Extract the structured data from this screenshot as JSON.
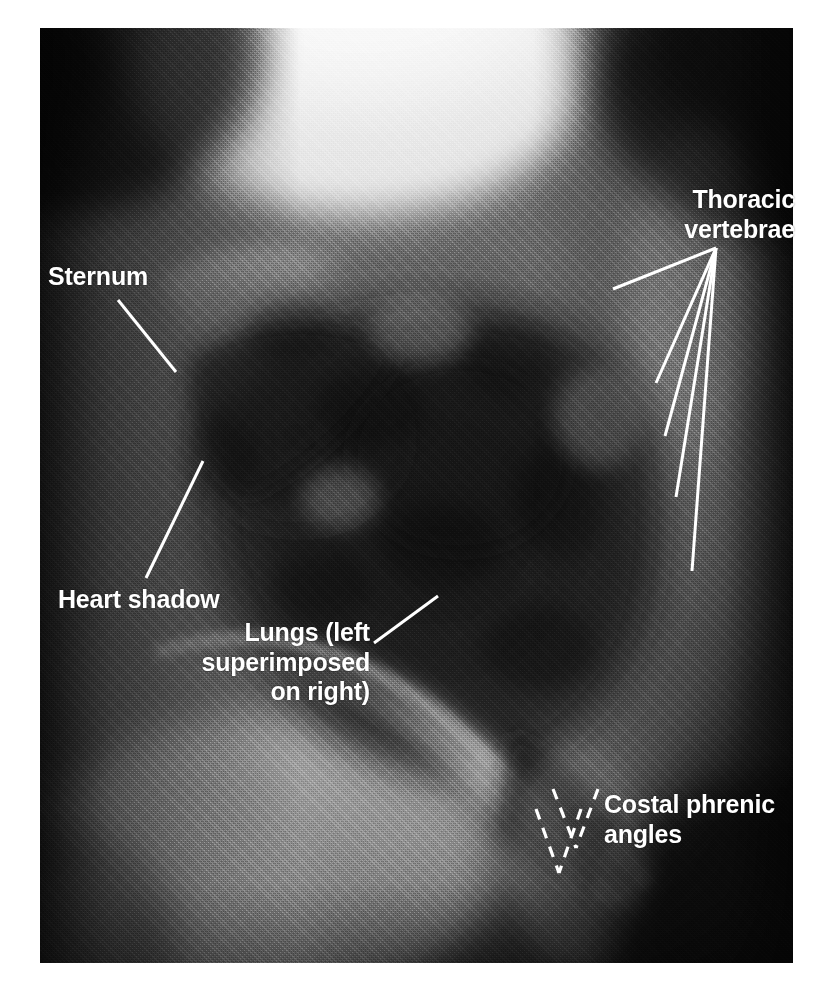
{
  "figure": {
    "kind": "annotated-lateral-chest-radiograph",
    "photo": {
      "x": 40,
      "y": 28,
      "width": 753,
      "height": 935
    },
    "page": {
      "width": 829,
      "height": 983,
      "background": "#ffffff"
    }
  },
  "colors": {
    "annotation_text": "#ffffff",
    "leader_line": "#ffffff",
    "page_background": "#ffffff",
    "film_dark": "#161616",
    "film_mid": "#6e6e6e",
    "film_bright": "#f2f2f2"
  },
  "annotations": [
    {
      "id": "sternum",
      "text": "Sternum",
      "lines": [
        "Sternum"
      ],
      "align": "left",
      "x": 48,
      "y": 262,
      "leaders": [
        {
          "x1": 118,
          "y1": 300,
          "x2": 176,
          "y2": 372
        }
      ],
      "leader_style": "solid"
    },
    {
      "id": "heart-shadow",
      "text": "Heart shadow",
      "lines": [
        "Heart shadow"
      ],
      "align": "left",
      "x": 58,
      "y": 585,
      "leaders": [
        {
          "x1": 146,
          "y1": 578,
          "x2": 203,
          "y2": 461
        }
      ],
      "leader_style": "solid"
    },
    {
      "id": "lungs",
      "text": "Lungs (left superimposed on right)",
      "lines": [
        "Lungs (left",
        "superimposed",
        "on right)"
      ],
      "align": "right",
      "x": 130,
      "y": 618,
      "width": 240,
      "leaders": [
        {
          "x1": 374,
          "y1": 643,
          "x2": 438,
          "y2": 596
        }
      ],
      "leader_style": "solid"
    },
    {
      "id": "thoracic-vertebrae",
      "text": "Thoracic vertebrae",
      "lines": [
        "Thoracic",
        "vertebrae"
      ],
      "align": "right",
      "x": 530,
      "y": 185,
      "width": 265,
      "leaders": [
        {
          "x1": 716,
          "y1": 248,
          "x2": 613,
          "y2": 289
        },
        {
          "x1": 716,
          "y1": 248,
          "x2": 656,
          "y2": 383
        },
        {
          "x1": 716,
          "y1": 248,
          "x2": 665,
          "y2": 436
        },
        {
          "x1": 716,
          "y1": 248,
          "x2": 676,
          "y2": 497
        },
        {
          "x1": 716,
          "y1": 248,
          "x2": 692,
          "y2": 571
        }
      ],
      "leader_style": "solid"
    },
    {
      "id": "costal-phrenic-angles",
      "text": "Costal phrenic angles",
      "lines": [
        "Costal phrenic",
        "angles"
      ],
      "align": "left",
      "x": 604,
      "y": 790,
      "width": 210,
      "leaders": [
        {
          "x1": 553,
          "y1": 789,
          "x2": 576,
          "y2": 848
        },
        {
          "x1": 598,
          "y1": 789,
          "x2": 576,
          "y2": 848
        },
        {
          "x1": 536,
          "y1": 809,
          "x2": 559,
          "y2": 873
        },
        {
          "x1": 581,
          "y1": 809,
          "x2": 559,
          "y2": 873
        }
      ],
      "leader_style": "dashed"
    }
  ],
  "xray_structures": [
    {
      "name": "sternum-band",
      "description": "bright anterior sternal band, upper-left of chest"
    },
    {
      "name": "heart-shadow-mass",
      "description": "dense dark cardiac silhouette, anterior mid chest"
    },
    {
      "name": "lung-field",
      "description": "large dark radiolucent lung field occupying the centre of the film"
    },
    {
      "name": "thoracic-spine",
      "description": "brighter vertical column of vertebral bodies on the right of the film"
    },
    {
      "name": "diaphragm-dome",
      "description": "bright curved diaphragm boundary crossing the lower film"
    },
    {
      "name": "costophrenic-recess",
      "description": "paired acute angles where diaphragm meets chest wall, lower right"
    }
  ]
}
